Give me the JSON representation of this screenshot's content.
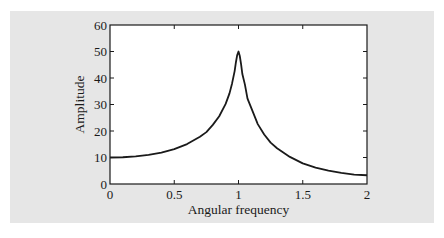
{
  "chart_data": {
    "type": "line",
    "title": "",
    "xlabel": "Angular frequency",
    "ylabel": "Amplitude",
    "xlim": [
      0,
      2
    ],
    "ylim": [
      0,
      60
    ],
    "xticks": [
      0,
      0.5,
      1,
      1.5,
      2
    ],
    "xtick_labels": [
      "0",
      "0.5",
      "1",
      "1.5",
      "2"
    ],
    "yticks": [
      0,
      10,
      20,
      30,
      40,
      50,
      60
    ],
    "ytick_labels": [
      "0",
      "10",
      "20",
      "30",
      "40",
      "50",
      "60"
    ],
    "grid": false,
    "legend": null,
    "series": [
      {
        "name": "Amplitude response",
        "color": "#1a1a1a",
        "x": [
          0,
          0.1,
          0.2,
          0.3,
          0.4,
          0.5,
          0.6,
          0.7,
          0.75,
          0.8,
          0.85,
          0.9,
          0.93,
          0.95,
          0.97,
          0.98,
          0.99,
          1.0,
          1.01,
          1.02,
          1.03,
          1.05,
          1.07,
          1.1,
          1.15,
          1.2,
          1.25,
          1.3,
          1.4,
          1.5,
          1.6,
          1.7,
          1.8,
          1.9,
          2.0
        ],
        "y": [
          10.0,
          10.1,
          10.41,
          10.96,
          11.85,
          13.16,
          15.08,
          17.82,
          19.57,
          22.3,
          25.57,
          30.22,
          34.2,
          37.96,
          42.6,
          45.95,
          48.7,
          50.0,
          48.3,
          45.2,
          41.5,
          37.5,
          32.2,
          28.6,
          22.6,
          18.7,
          15.6,
          13.5,
          10.23,
          7.78,
          6.19,
          5.04,
          4.17,
          3.52,
          3.3
        ]
      }
    ]
  },
  "panel": {
    "background": "#e6e6e6"
  }
}
